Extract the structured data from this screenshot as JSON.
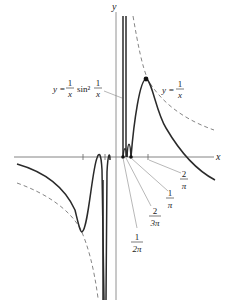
{
  "figure": {
    "axes": {
      "x_label": "x",
      "y_label": "y"
    },
    "curves": {
      "main": {
        "label_lhs": "y =",
        "label_frac_num": "1",
        "label_frac_den": "x",
        "label_func": "sin²",
        "label_frac2_num": "1",
        "label_frac2_den": "x"
      },
      "envelope": {
        "label_lhs": "y =",
        "label_frac_num": "1",
        "label_frac_den": "x",
        "style": "dashed"
      }
    },
    "ticks": [
      {
        "num": "1",
        "den": "2π"
      },
      {
        "num": "2",
        "den": "3π"
      },
      {
        "num": "1",
        "den": "π"
      },
      {
        "num": "2",
        "den": "π"
      }
    ],
    "colors": {
      "curve": "#333333",
      "axis": "#555555",
      "dashed": "#777777",
      "text": "#222222"
    }
  }
}
